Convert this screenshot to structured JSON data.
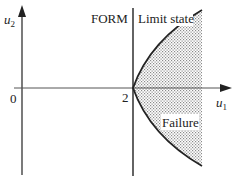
{
  "diagram": {
    "axes": {
      "x_label": "u",
      "x_sub": "1",
      "y_label": "u",
      "y_sub": "2",
      "origin_label": "0",
      "tick_label": "2"
    },
    "labels": {
      "form": "FORM",
      "limit_state": "Limit state",
      "failure": "Failure"
    },
    "colors": {
      "line": "#222222",
      "shade_dot": "#8a8a8a"
    }
  }
}
